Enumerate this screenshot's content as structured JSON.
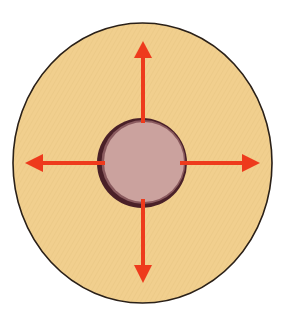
{
  "diagram": {
    "colors": {
      "outer_fill": "#f1cf8e",
      "outer_stroke": "#2a2018",
      "ring_dark": "#4a2028",
      "ring_light": "#8a5a5e",
      "core_fill": "#cba29e",
      "arrow": "#ee3a1c",
      "background": "#ffffff"
    },
    "outer_ellipse": {
      "cx": 142.5,
      "cy": 163,
      "rx": 129.5,
      "ry": 140
    },
    "inner_circle": {
      "cx": 142,
      "cy": 163,
      "r": 45
    },
    "arrows": [
      {
        "direction": "up",
        "from": [
          143,
          123
        ],
        "to": [
          143,
          41
        ]
      },
      {
        "direction": "down",
        "from": [
          143,
          199
        ],
        "to": [
          143,
          283
        ]
      },
      {
        "direction": "left",
        "from": [
          105,
          163
        ],
        "to": [
          25,
          163
        ]
      },
      {
        "direction": "right",
        "from": [
          180,
          163
        ],
        "to": [
          260,
          163
        ]
      }
    ]
  }
}
